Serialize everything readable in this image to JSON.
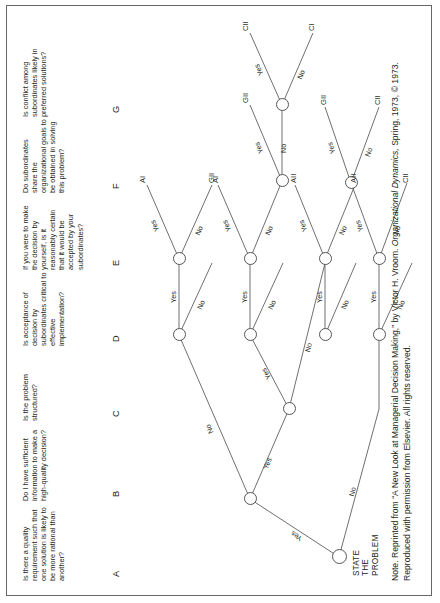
{
  "figure": {
    "type": "decision-tree",
    "root_label": "STATE THE\nPROBLEM",
    "root_line1": "STATE",
    "root_line2": "THE",
    "root_line3": "PROBLEM",
    "note": "Note. Reprinted from “A New Look at Managerial Decision Making,” by Victor H. Vroom. Organizational Dynamics, Spring, 1973, © 1973. Reproduced with permission from Elsevier. All rights reserved.",
    "note_prefix": "Note. Reprinted from “A New Look at Managerial Decision Making,” by Victor H. Vroom. ",
    "note_italic": "Organizational Dynamics,",
    "note_suffix": " Spring, 1973, © 1973. Reproduced with permission from Elsevier. All rights reserved."
  },
  "columns": [
    {
      "letter": "A",
      "question": "Is there a quality requirement such that one solution is likely to be more rational than another?"
    },
    {
      "letter": "B",
      "question": "Do I have sufficient information to make a high-quality decision?"
    },
    {
      "letter": "C",
      "question": "Is the problem structured?"
    },
    {
      "letter": "D",
      "question": "Is acceptance of decision by subordinates critical to effective implementation?"
    },
    {
      "letter": "E",
      "question": "If you were to make the decision by yourself, is it reasonably certain that it would be accepted by your subordinates?"
    },
    {
      "letter": "F",
      "question": "Do subordinates share the organizational goals to be obtained in solving this problem?"
    },
    {
      "letter": "G",
      "question": "Is conflict among subordinates likely in preferred solutions?"
    }
  ],
  "edge_labels": {
    "yes": "Yes",
    "no": "No"
  },
  "outcomes": {
    "AI": "AI",
    "AII": "AII",
    "CI": "CI",
    "CII": "CII",
    "GII": "GII"
  },
  "branches": [
    {
      "id": "A-yes",
      "label": "Yes"
    },
    {
      "id": "A-no",
      "label": "No"
    },
    {
      "id": "B-yes",
      "label": "Yes"
    },
    {
      "id": "B-no",
      "label": "No"
    },
    {
      "id": "C-yes",
      "label": "Yes"
    },
    {
      "id": "C-no",
      "label": "No"
    },
    {
      "id": "D1-yes",
      "label": "Yes"
    },
    {
      "id": "D1-no",
      "label": "No"
    },
    {
      "id": "D2-yes",
      "label": "Yes"
    },
    {
      "id": "D2-no",
      "label": "No"
    },
    {
      "id": "D3-yes",
      "label": "Yes"
    },
    {
      "id": "D3-no",
      "label": "No"
    },
    {
      "id": "D4-yes",
      "label": "Yes"
    },
    {
      "id": "D4-no",
      "label": "No"
    },
    {
      "id": "E1-yes",
      "label": "Yes"
    },
    {
      "id": "E1-no",
      "label": "No"
    },
    {
      "id": "E2-yes",
      "label": "Yes"
    },
    {
      "id": "E2-no",
      "label": "No"
    },
    {
      "id": "E3-yes",
      "label": "Yes"
    },
    {
      "id": "E3-no",
      "label": "No"
    },
    {
      "id": "E4-yes",
      "label": "Yes"
    },
    {
      "id": "E4-no",
      "label": "No"
    },
    {
      "id": "F1-yes",
      "label": "Yes"
    },
    {
      "id": "F1-no",
      "label": "No"
    },
    {
      "id": "F2-yes",
      "label": "Yes"
    },
    {
      "id": "F2-no",
      "label": "No"
    },
    {
      "id": "G1-yes",
      "label": "Yes"
    },
    {
      "id": "G1-no",
      "label": "No"
    }
  ],
  "leaves": [
    {
      "id": "leaf-1",
      "label": "AI"
    },
    {
      "id": "leaf-2",
      "label": "GII"
    },
    {
      "id": "leaf-3",
      "label": "AI"
    },
    {
      "id": "leaf-4",
      "label": "CII"
    },
    {
      "id": "leaf-5",
      "label": "CI"
    },
    {
      "id": "leaf-6",
      "label": "GII"
    },
    {
      "id": "leaf-7",
      "label": "AII"
    },
    {
      "id": "leaf-8",
      "label": "AII"
    },
    {
      "id": "leaf-9",
      "label": "CII"
    },
    {
      "id": "leaf-10",
      "label": "GII"
    },
    {
      "id": "leaf-11",
      "label": "CII"
    },
    {
      "id": "leaf-12",
      "label": "CII"
    }
  ]
}
